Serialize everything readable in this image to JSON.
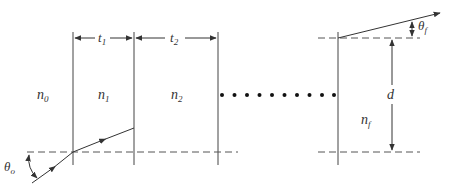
{
  "diagram": {
    "type": "multilayer-optical-stack",
    "layers": [
      {
        "index_label": "n",
        "index_sub": "0"
      },
      {
        "index_label": "n",
        "index_sub": "1"
      },
      {
        "index_label": "n",
        "index_sub": "2"
      },
      {
        "index_label": "n",
        "index_sub": "f"
      }
    ],
    "thicknesses": [
      {
        "label": "t",
        "sub": "1"
      },
      {
        "label": "t",
        "sub": "2"
      }
    ],
    "angles": {
      "incident": {
        "label": "θ",
        "sub": "o"
      },
      "final": {
        "label": "θ",
        "sub": "f"
      }
    },
    "displacement": {
      "label": "d"
    },
    "ellipsis_dot_count": 10,
    "colors": {
      "line": "#333333",
      "dash": "#555555",
      "background": "#ffffff"
    }
  }
}
